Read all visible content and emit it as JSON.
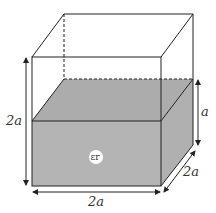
{
  "diagram": {
    "type": "3d-box-partially-filled-dielectric",
    "labels": {
      "height_total": "2a",
      "fill_height": "a",
      "depth": "2a",
      "width": "2a",
      "dielectric": "εr"
    },
    "colors": {
      "line": "#222222",
      "fill": "#b4b4b4",
      "fill_top": "#a8a8a8",
      "background": "#ffffff"
    }
  }
}
